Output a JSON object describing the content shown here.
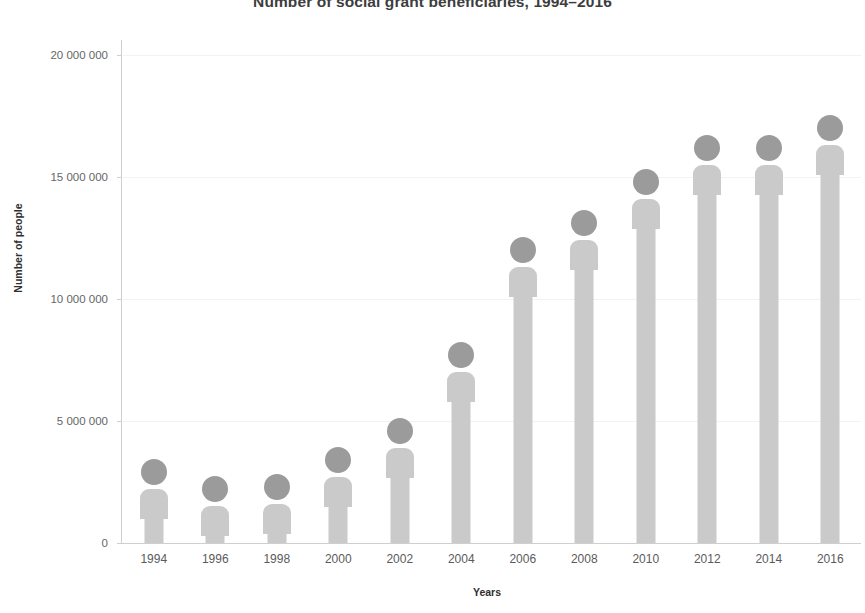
{
  "chart_data": {
    "type": "bar",
    "title": "Number of social grant beneficiaries, 1994–2016",
    "xlabel": "Years",
    "ylabel": "Number of people",
    "categories": [
      "1994",
      "1996",
      "1998",
      "2000",
      "2002",
      "2004",
      "2006",
      "2008",
      "2010",
      "2012",
      "2014",
      "2016"
    ],
    "values": [
      2200000,
      1500000,
      1600000,
      2700000,
      3900000,
      7000000,
      11300000,
      12400000,
      14100000,
      15500000,
      15500000,
      16300000
    ],
    "ylim": [
      0,
      20000000
    ],
    "ytick_values": [
      0,
      5000000,
      10000000,
      15000000,
      20000000
    ],
    "ytick_labels": [
      "0",
      "5 000 000",
      "10 000 000",
      "15 000 000",
      "20 000 000"
    ],
    "grid": "faint-horizontal",
    "legend": "none",
    "marker_style": "person-pictogram",
    "colors": {
      "head": "#9b9b9b",
      "body": "#cacaca",
      "axis": "#cfcfcf",
      "gridline": "#f2f2f2",
      "title_text": "#3d3d3d",
      "tick_text": "#5b5b5b",
      "background": "#ffffff"
    }
  }
}
